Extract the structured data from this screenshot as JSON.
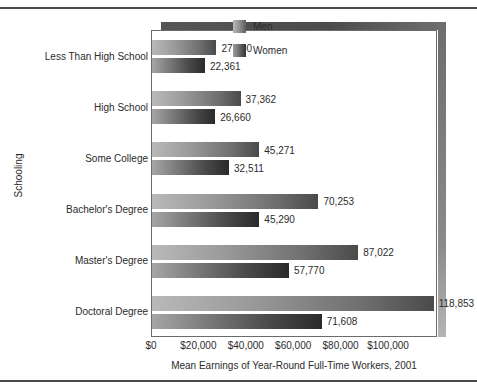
{
  "chart_data": {
    "type": "bar",
    "orientation": "horizontal",
    "title": "",
    "xlabel": "Mean Earnings of Year-Round Full-Time Workers, 2001",
    "ylabel": "Schooling",
    "categories": [
      "Less Than High School",
      "High School",
      "Some College",
      "Bachelor's Degree",
      "Master's Degree",
      "Doctoral Degree"
    ],
    "series": [
      {
        "name": "Men",
        "values": [
          27190,
          37362,
          45271,
          70253,
          87022,
          118853
        ],
        "labels": [
          "27,190",
          "37,362",
          "45,271",
          "70,253",
          "87,022",
          "118,853"
        ]
      },
      {
        "name": "Women",
        "values": [
          22361,
          26660,
          32511,
          45290,
          57770,
          71608
        ],
        "labels": [
          "22,361",
          "26,660",
          "32,511",
          "45,290",
          "57,770",
          "71,608"
        ]
      }
    ],
    "xlim": [
      0,
      120000
    ],
    "xticks": [
      0,
      20000,
      40000,
      60000,
      80000,
      100000
    ],
    "xtick_labels": [
      "$0",
      "$20,000",
      "$40,000",
      "$60,000",
      "$80,000",
      "$100,000"
    ],
    "grid": false,
    "legend_position": "top-right"
  },
  "legend": {
    "entries": [
      {
        "label": "Men",
        "swatch": "men-gradient-swatch"
      },
      {
        "label": "Women",
        "swatch": "women-gradient-swatch"
      }
    ]
  }
}
